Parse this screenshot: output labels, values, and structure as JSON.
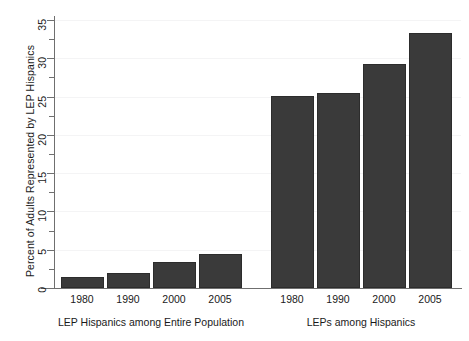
{
  "chart_data": {
    "type": "bar",
    "title": "",
    "xlabel": "",
    "ylabel": "Percent of Adults Represented by LEP Hispanics",
    "ylim": [
      0,
      36.5
    ],
    "yticks": [
      0,
      5,
      10,
      15,
      20,
      25,
      30,
      35
    ],
    "ytick_labels": [
      "0",
      "5",
      "10",
      "15",
      "20",
      "25",
      "30",
      "35"
    ],
    "minor_yticks": [
      2.5,
      7.5,
      12.5,
      17.5,
      22.5,
      27.5,
      32.5
    ],
    "grid": "horizontal-faint",
    "legend": "none",
    "bar_color": "#3a3a3a",
    "categories": [
      "1980",
      "1990",
      "2000",
      "2005"
    ],
    "groups": [
      {
        "name": "LEP Hispanics among Entire Population",
        "categories": [
          "1980",
          "1990",
          "2000",
          "2005"
        ],
        "values": [
          1.5,
          2.0,
          3.4,
          4.5
        ]
      },
      {
        "name": "LEPs among Hispanics",
        "categories": [
          "1980",
          "1990",
          "2000",
          "2005"
        ],
        "values": [
          25.1,
          25.5,
          29.2,
          33.3
        ]
      }
    ]
  },
  "axis": {
    "y_title": "Percent of Adults Represented by LEP Hispanics"
  },
  "group_labels": {
    "left": "LEP Hispanics among Entire Population",
    "right": "LEPs among Hispanics"
  },
  "tick_labels": {
    "y": [
      "0",
      "5",
      "10",
      "15",
      "20",
      "25",
      "30",
      "35"
    ],
    "x_left": [
      "1980",
      "1990",
      "2000",
      "2005"
    ],
    "x_right": [
      "1980",
      "1990",
      "2000",
      "2005"
    ]
  },
  "colors": {
    "bar": "#3a3a3a",
    "bar_edge": "#2c2c2c",
    "axis": "#6f6f6f",
    "grid": "#f4f4f5",
    "text": "#1a1a1a",
    "background": "#ffffff"
  }
}
